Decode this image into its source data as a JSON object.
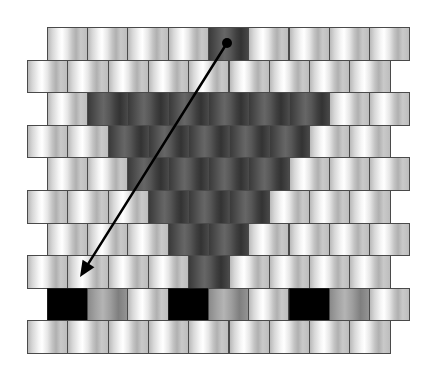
{
  "diagram": {
    "type": "brick-stitch bead pattern",
    "rows": 10,
    "beads_per_row": 9,
    "bead_width": 40.3,
    "row_height": 32.6,
    "origin_y": 27,
    "even_row_x": 46.7,
    "odd_row_x": 27,
    "colors": {
      "light": "#e0e0e0",
      "dark": "#4f4f4f",
      "mid": "#a0a0a0",
      "black": "#000000",
      "border": "#4a4a4a",
      "arrow": "#000000"
    },
    "pattern": [
      [
        "light",
        "light",
        "light",
        "light",
        "dark",
        "light",
        "light",
        "light",
        "light"
      ],
      [
        "light",
        "light",
        "light",
        "light",
        "light",
        "light",
        "light",
        "light",
        "light"
      ],
      [
        "light",
        "dark",
        "dark",
        "dark",
        "dark",
        "dark",
        "dark",
        "light",
        "light"
      ],
      [
        "light",
        "light",
        "dark",
        "dark",
        "dark",
        "dark",
        "dark",
        "light",
        "light"
      ],
      [
        "light",
        "light",
        "dark",
        "dark",
        "dark",
        "dark",
        "light",
        "light",
        "light"
      ],
      [
        "light",
        "light",
        "light",
        "dark",
        "dark",
        "dark",
        "light",
        "light",
        "light"
      ],
      [
        "light",
        "light",
        "light",
        "dark",
        "dark",
        "light",
        "light",
        "light",
        "light"
      ],
      [
        "light",
        "light",
        "light",
        "light",
        "dark",
        "light",
        "light",
        "light",
        "light"
      ],
      [
        "black",
        "mid",
        "light",
        "black",
        "mid",
        "light",
        "black",
        "mid",
        "light"
      ],
      [
        "light",
        "light",
        "light",
        "light",
        "light",
        "light",
        "light",
        "light",
        "light"
      ]
    ],
    "arrow": {
      "start": [
        227,
        43
      ],
      "end": [
        80,
        277
      ],
      "start_marker": "dot",
      "end_marker": "arrowhead",
      "dot_radius": 5
    }
  }
}
